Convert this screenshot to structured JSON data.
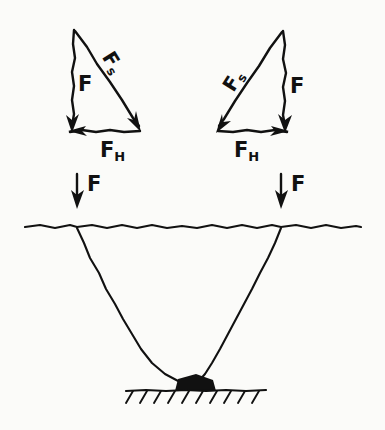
{
  "figure": {
    "background_color": "#fbfbf9",
    "ink_color": "#111111"
  },
  "left_triangle": {
    "name": "left-force-triangle",
    "vertical_force_label": "F",
    "diagonal_force_label": "Fs",
    "diagonal_force_base": "F",
    "diagonal_force_sub": "s",
    "horizontal_force_base": "F",
    "horizontal_force_sub": "H",
    "horizontal_force_label": "FH",
    "horizontal_arrow_direction": "left",
    "vertical_arrow_direction": "down",
    "diagonal_arrow_direction": "down-right"
  },
  "right_triangle": {
    "name": "right-force-triangle",
    "vertical_force_label": "F",
    "diagonal_force_label": "Fs",
    "diagonal_force_base": "F",
    "diagonal_force_sub": "s",
    "horizontal_force_base": "F",
    "horizontal_force_sub": "H",
    "horizontal_force_label": "FH",
    "horizontal_arrow_direction": "right",
    "vertical_arrow_direction": "down",
    "diagonal_arrow_direction": "down-left"
  },
  "applied_forces": [
    {
      "name": "left-applied-force",
      "label": "F",
      "direction": "down"
    },
    {
      "name": "right-applied-force",
      "label": "F",
      "direction": "down"
    }
  ],
  "structure": {
    "horizontal_rope_name": "horizontal-rope-line",
    "left_cable_name": "left-cable",
    "right_cable_name": "right-cable",
    "anchor_name": "ground-anchor-knot",
    "ground_name": "ground-hatching"
  }
}
